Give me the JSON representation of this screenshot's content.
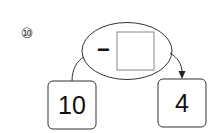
{
  "problem": {
    "number_label": "⑩",
    "operator": "−",
    "start_value": "10",
    "result_value": "4",
    "blank_value": ""
  },
  "colors": {
    "stroke": "#333333",
    "blank_box": "#888888",
    "background": "#ffffff"
  }
}
